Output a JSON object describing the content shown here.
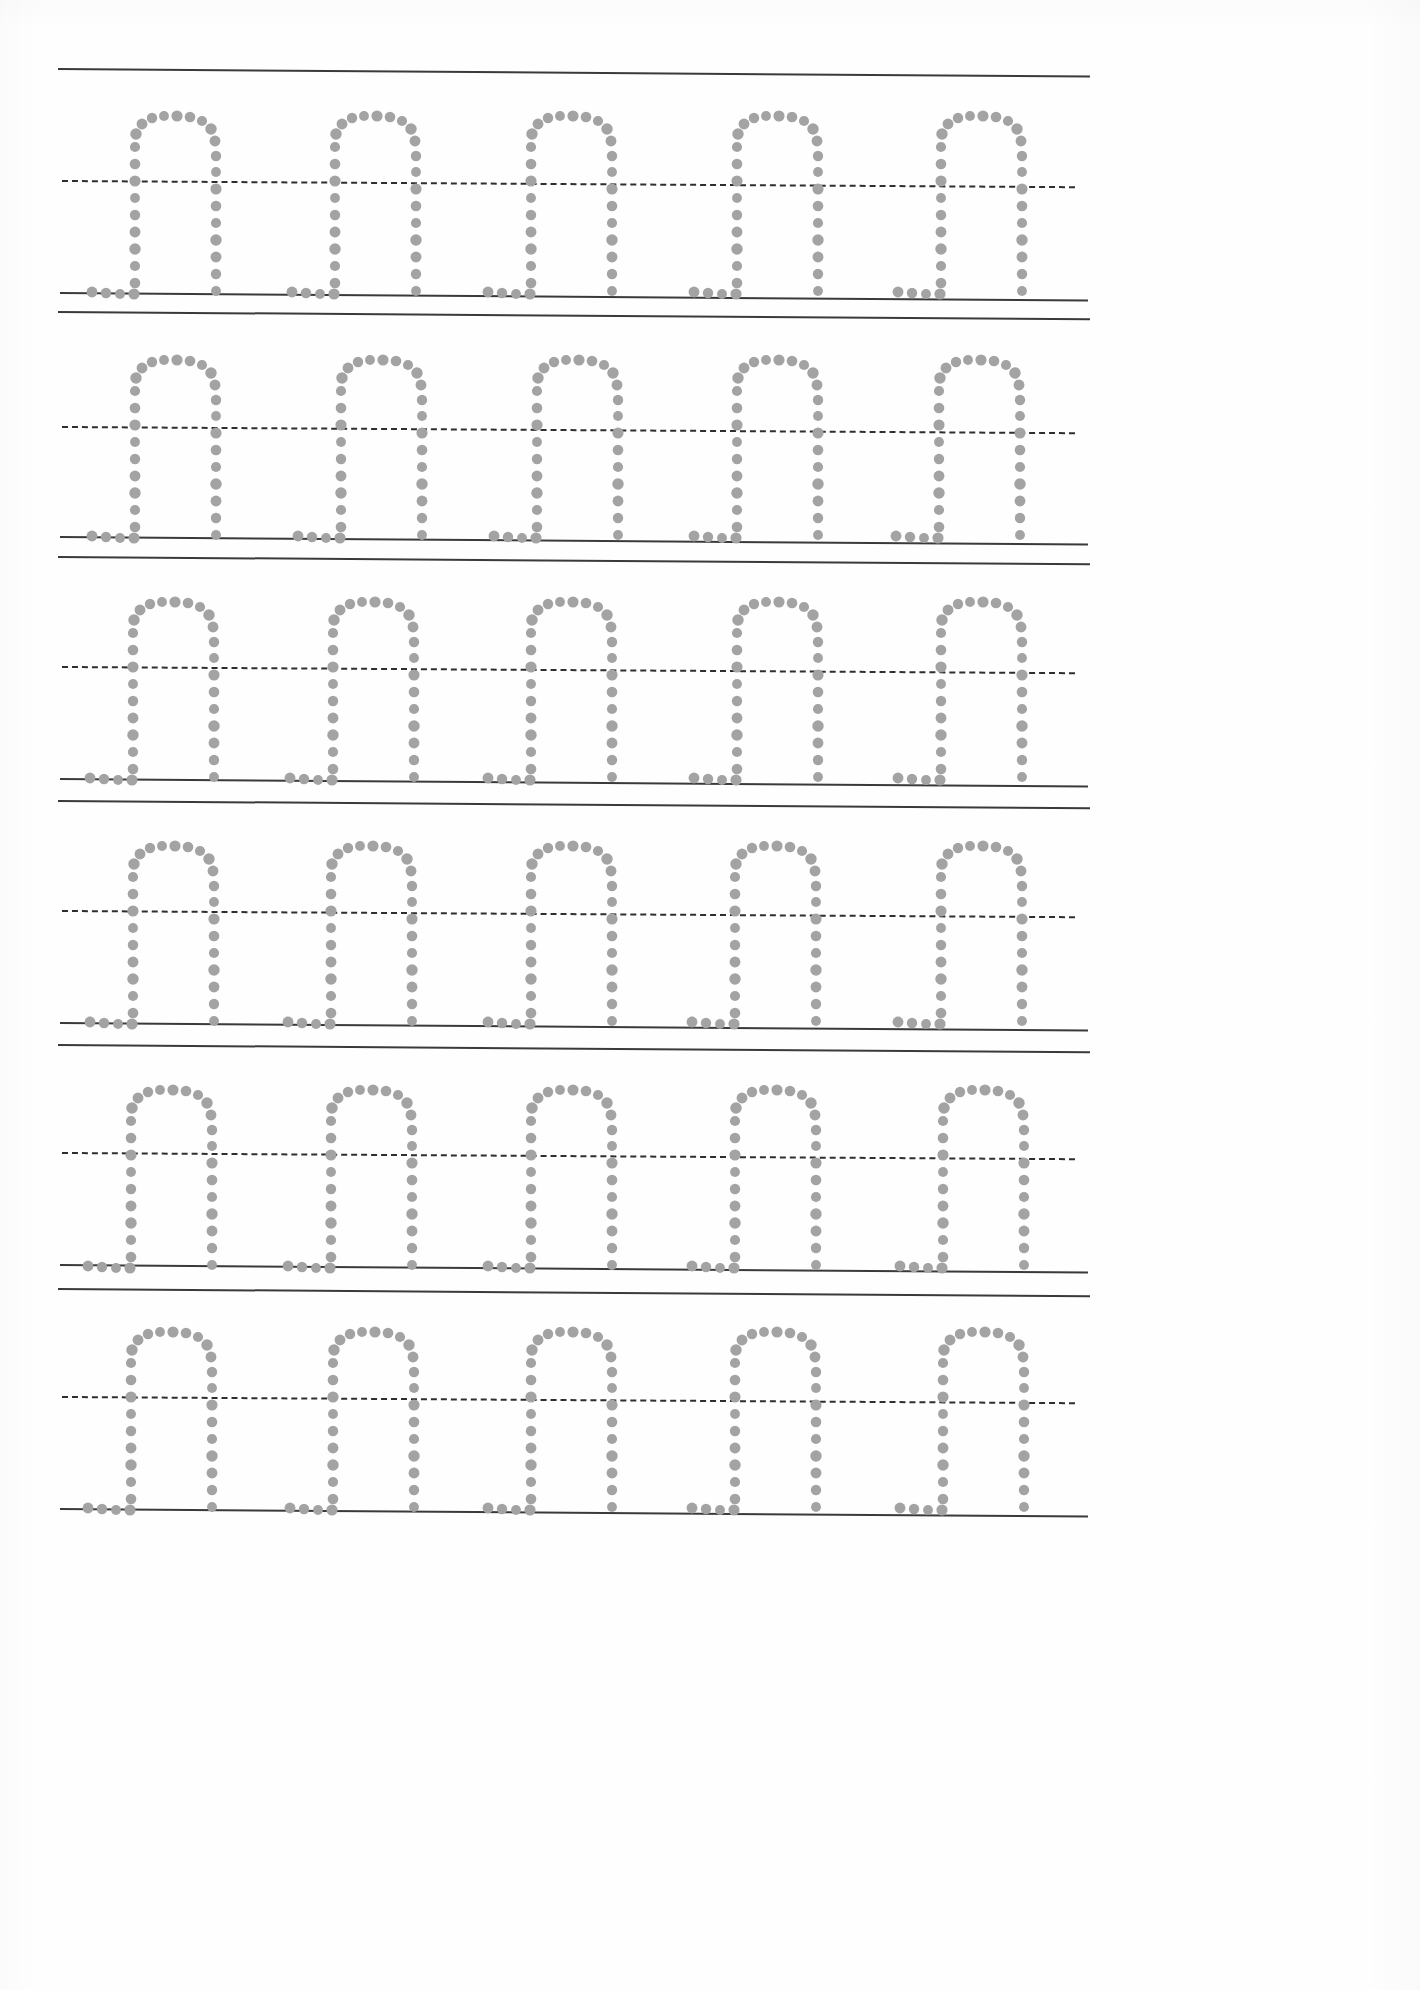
{
  "document": {
    "type": "handwriting-practice-worksheet",
    "title": "Letter n Tracing Practice",
    "page_width": 1420,
    "page_height": 1990,
    "background_color": "#ffffff",
    "traced_letter": "n",
    "letters_per_row": 5,
    "row_count": 6,
    "dot_color": "#a3a3a3",
    "rule_line_color": "#3a3a3a",
    "midline_color": "#2e2e2e",
    "midline_style": "dashed",
    "rule_line_style": "solid"
  },
  "rows": [
    {
      "index": 1,
      "label": "practice-row-1",
      "top_line_y": 68,
      "top_line_x_start": 58,
      "top_line_x_end": 1090,
      "top_line_tilt_deg": 0.42,
      "midline_y": 180,
      "midline_x_start": 62,
      "midline_x_end": 1075,
      "midline_tilt_deg": 0.35,
      "base_line_y": 292,
      "base_line_x_start": 60,
      "base_line_x_end": 1088,
      "base_line_tilt_deg": 0.42,
      "letter_top_y": 108,
      "letter_base_y": 288,
      "letters": [
        {
          "x": 128,
          "label": "trace-letter-n"
        },
        {
          "x": 328,
          "label": "trace-letter-n"
        },
        {
          "x": 524,
          "label": "trace-letter-n"
        },
        {
          "x": 730,
          "label": "trace-letter-n"
        },
        {
          "x": 934,
          "label": "trace-letter-n"
        }
      ]
    },
    {
      "index": 2,
      "label": "practice-row-2",
      "top_line_y": 311,
      "top_line_x_start": 58,
      "top_line_x_end": 1090,
      "top_line_tilt_deg": 0.4,
      "midline_y": 426,
      "midline_x_start": 62,
      "midline_x_end": 1075,
      "midline_tilt_deg": 0.35,
      "base_line_y": 536,
      "base_line_x_start": 60,
      "base_line_x_end": 1088,
      "base_line_tilt_deg": 0.42,
      "letter_top_y": 352,
      "letter_base_y": 532,
      "letters": [
        {
          "x": 128,
          "label": "trace-letter-n"
        },
        {
          "x": 334,
          "label": "trace-letter-n"
        },
        {
          "x": 530,
          "label": "trace-letter-n"
        },
        {
          "x": 730,
          "label": "trace-letter-n"
        },
        {
          "x": 932,
          "label": "trace-letter-n"
        }
      ]
    },
    {
      "index": 3,
      "label": "practice-row-3",
      "top_line_y": 556,
      "top_line_x_start": 58,
      "top_line_x_end": 1090,
      "top_line_tilt_deg": 0.4,
      "midline_y": 666,
      "midline_x_start": 62,
      "midline_x_end": 1075,
      "midline_tilt_deg": 0.35,
      "base_line_y": 778,
      "base_line_x_start": 60,
      "base_line_x_end": 1088,
      "base_line_tilt_deg": 0.42,
      "letter_top_y": 594,
      "letter_base_y": 774,
      "letters": [
        {
          "x": 126,
          "label": "trace-letter-n"
        },
        {
          "x": 326,
          "label": "trace-letter-n"
        },
        {
          "x": 524,
          "label": "trace-letter-n"
        },
        {
          "x": 730,
          "label": "trace-letter-n"
        },
        {
          "x": 934,
          "label": "trace-letter-n"
        }
      ]
    },
    {
      "index": 4,
      "label": "practice-row-4",
      "top_line_y": 800,
      "top_line_x_start": 58,
      "top_line_x_end": 1090,
      "top_line_tilt_deg": 0.4,
      "midline_y": 910,
      "midline_x_start": 62,
      "midline_x_end": 1075,
      "midline_tilt_deg": 0.35,
      "base_line_y": 1022,
      "base_line_x_start": 60,
      "base_line_x_end": 1088,
      "base_line_tilt_deg": 0.42,
      "letter_top_y": 838,
      "letter_base_y": 1018,
      "letters": [
        {
          "x": 126,
          "label": "trace-letter-n"
        },
        {
          "x": 324,
          "label": "trace-letter-n"
        },
        {
          "x": 524,
          "label": "trace-letter-n"
        },
        {
          "x": 728,
          "label": "trace-letter-n"
        },
        {
          "x": 934,
          "label": "trace-letter-n"
        }
      ]
    },
    {
      "index": 5,
      "label": "practice-row-5",
      "top_line_y": 1044,
      "top_line_x_start": 58,
      "top_line_x_end": 1090,
      "top_line_tilt_deg": 0.4,
      "midline_y": 1152,
      "midline_x_start": 62,
      "midline_x_end": 1075,
      "midline_tilt_deg": 0.35,
      "base_line_y": 1264,
      "base_line_x_start": 60,
      "base_line_x_end": 1088,
      "base_line_tilt_deg": 0.42,
      "letter_top_y": 1082,
      "letter_base_y": 1260,
      "letters": [
        {
          "x": 124,
          "label": "trace-letter-n"
        },
        {
          "x": 324,
          "label": "trace-letter-n"
        },
        {
          "x": 524,
          "label": "trace-letter-n"
        },
        {
          "x": 728,
          "label": "trace-letter-n"
        },
        {
          "x": 936,
          "label": "trace-letter-n"
        }
      ]
    },
    {
      "index": 6,
      "label": "practice-row-6",
      "top_line_y": 1288,
      "top_line_x_start": 58,
      "top_line_x_end": 1090,
      "top_line_tilt_deg": 0.4,
      "midline_y": 1396,
      "midline_x_start": 62,
      "midline_x_end": 1075,
      "midline_tilt_deg": 0.35,
      "base_line_y": 1508,
      "base_line_x_start": 60,
      "base_line_x_end": 1088,
      "base_line_tilt_deg": 0.42,
      "letter_top_y": 1324,
      "letter_base_y": 1504,
      "letters": [
        {
          "x": 124,
          "label": "trace-letter-n"
        },
        {
          "x": 326,
          "label": "trace-letter-n"
        },
        {
          "x": 524,
          "label": "trace-letter-n"
        },
        {
          "x": 728,
          "label": "trace-letter-n"
        },
        {
          "x": 936,
          "label": "trace-letter-n"
        }
      ]
    }
  ],
  "letter_glyph": {
    "name": "lowercase-n-dotted-outline",
    "width": 120,
    "height": 182,
    "dot_radius": 5.4,
    "description": "Dotted outline of lowercase n: left stem with baseline serif foot, rounded shoulder arch, right stem",
    "dots": [
      {
        "x": 88,
        "y": 177
      },
      {
        "x": 88,
        "y": 160
      },
      {
        "x": 88,
        "y": 143
      },
      {
        "x": 88,
        "y": 126
      },
      {
        "x": 88,
        "y": 109
      },
      {
        "x": 88,
        "y": 92
      },
      {
        "x": 88,
        "y": 75
      },
      {
        "x": 88,
        "y": 58
      },
      {
        "x": 88,
        "y": 42
      },
      {
        "x": 87,
        "y": 27
      },
      {
        "x": 83,
        "y": 15
      },
      {
        "x": 74,
        "y": 7
      },
      {
        "x": 62,
        "y": 3
      },
      {
        "x": 49,
        "y": 2
      },
      {
        "x": 36,
        "y": 2
      },
      {
        "x": 24,
        "y": 4
      },
      {
        "x": 14,
        "y": 10
      },
      {
        "x": 8,
        "y": 20
      },
      {
        "x": 7,
        "y": 33
      },
      {
        "x": 7,
        "y": 50
      },
      {
        "x": 7,
        "y": 67
      },
      {
        "x": 7,
        "y": 84
      },
      {
        "x": 7,
        "y": 101
      },
      {
        "x": 7,
        "y": 118
      },
      {
        "x": 7,
        "y": 135
      },
      {
        "x": 7,
        "y": 152
      },
      {
        "x": 7,
        "y": 169
      },
      {
        "x": 6,
        "y": 180
      },
      {
        "x": -8,
        "y": 180
      },
      {
        "x": -22,
        "y": 179
      },
      {
        "x": -36,
        "y": 178
      }
    ]
  }
}
